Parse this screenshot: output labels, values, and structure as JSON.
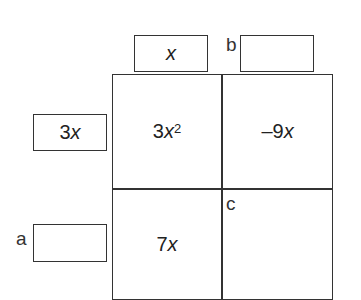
{
  "diagram": {
    "type": "area-model-multiplication",
    "top_factors": [
      {
        "label": "",
        "value_coeff": "",
        "value_var": "x"
      },
      {
        "label": "b",
        "value_coeff": "",
        "value_var": ""
      }
    ],
    "left_factors": [
      {
        "label": "",
        "value_coeff": "3",
        "value_var": "x"
      },
      {
        "label": "a",
        "value_coeff": "",
        "value_var": ""
      }
    ],
    "cells": [
      {
        "row": 0,
        "col": 0,
        "coeff": "3",
        "var": "x",
        "exp": "2",
        "label": ""
      },
      {
        "row": 0,
        "col": 1,
        "coeff": "–9",
        "var": "x",
        "exp": "",
        "label": ""
      },
      {
        "row": 1,
        "col": 0,
        "coeff": "7",
        "var": "x",
        "exp": "",
        "label": ""
      },
      {
        "row": 1,
        "col": 1,
        "coeff": "",
        "var": "",
        "exp": "",
        "label": "c"
      }
    ]
  }
}
